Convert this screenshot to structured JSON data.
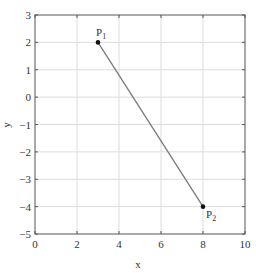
{
  "chart_data": {
    "type": "line",
    "title": "",
    "xlabel": "x",
    "ylabel": "y",
    "xlim": [
      0,
      10
    ],
    "ylim": [
      -5,
      3
    ],
    "xticks": [
      0,
      2,
      4,
      6,
      8,
      10
    ],
    "yticks": [
      3,
      2,
      1,
      0,
      -1,
      -2,
      -3,
      -4,
      -5
    ],
    "grid": true,
    "legend": null,
    "series": [
      {
        "name": "segment P1-P2",
        "x": [
          3,
          8
        ],
        "y": [
          2,
          -4
        ],
        "color": "#7a7a7a"
      }
    ],
    "points": [
      {
        "label": "P",
        "sub": "1",
        "x": 3,
        "y": 2
      },
      {
        "label": "P",
        "sub": "2",
        "x": 8,
        "y": -4
      }
    ]
  }
}
